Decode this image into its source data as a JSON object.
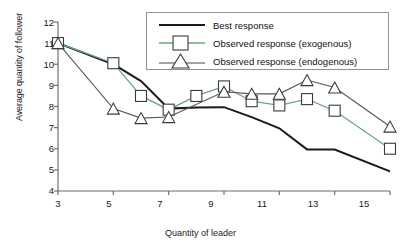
{
  "chart_data": {
    "type": "line",
    "title": "",
    "xlabel": "Quantity of leader",
    "ylabel": "Average quantity of follower",
    "xlim": [
      3,
      15
    ],
    "ylim": [
      4,
      12
    ],
    "xticks": [
      "3",
      "5",
      "7",
      "9",
      "11",
      "13",
      "15"
    ],
    "yticks": [
      "4",
      "5",
      "6",
      "7",
      "8",
      "9",
      "10",
      "11",
      "12"
    ],
    "grid": false,
    "legend_position": "top-right",
    "x": [
      3,
      4,
      5,
      6,
      7,
      8,
      9,
      10,
      11,
      12,
      13,
      14,
      15
    ],
    "series": [
      {
        "name": "Best response",
        "marker": "none",
        "color": "#1a1a1a",
        "x": [
          3,
          5,
          6,
          7,
          8,
          9,
          10,
          11,
          12,
          13,
          15
        ],
        "values": [
          11.0,
          10.0,
          9.2,
          7.9,
          7.95,
          7.97,
          7.5,
          6.97,
          5.97,
          5.96,
          4.93
        ]
      },
      {
        "name": "Observed response (exogenous)",
        "marker": "square",
        "color": "#2e7d46",
        "x": [
          3,
          5,
          6,
          7,
          8,
          9,
          10,
          11,
          12,
          13,
          15
        ],
        "values": [
          11.0,
          10.05,
          8.5,
          7.85,
          8.5,
          8.95,
          8.25,
          8.05,
          8.35,
          7.8,
          6.0
        ]
      },
      {
        "name": "Observed response (endogenous)",
        "marker": "triangle",
        "color": "#4a4a4a",
        "x": [
          3,
          5,
          6,
          7,
          9,
          10,
          11,
          12,
          13,
          15
        ],
        "values": [
          11.0,
          7.9,
          7.45,
          7.5,
          8.7,
          8.6,
          8.6,
          9.25,
          8.9,
          7.05
        ]
      }
    ],
    "legend": [
      {
        "label": "Best response",
        "marker": "none",
        "color": "#1a1a1a"
      },
      {
        "label": "Observed response (exogenous)",
        "marker": "square",
        "color": "#5fae74"
      },
      {
        "label": "Observed response (endogenous)",
        "marker": "triangle",
        "color": "#4a4a4a"
      }
    ]
  }
}
